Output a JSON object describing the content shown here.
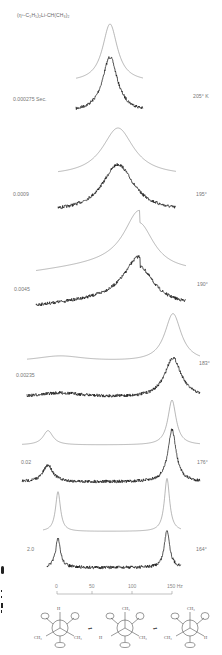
{
  "figure": {
    "title": "(η⁵-C₅H₅)₂Li-CH(CH₃)₂",
    "x_axis": {
      "unit": "Hz",
      "ticks": [
        {
          "value": 0,
          "label": "0"
        },
        {
          "value": 50,
          "label": "50"
        },
        {
          "value": 100,
          "label": "100"
        },
        {
          "value": 150,
          "label": "150 Hz"
        }
      ]
    },
    "rows": [
      {
        "lifetime_label": "0.000275 Sec.",
        "temperature_label": "205° K"
      },
      {
        "lifetime_label": "0.0009",
        "temperature_label": "195°"
      },
      {
        "lifetime_label": "0.0045",
        "temperature_label": "190°"
      },
      {
        "lifetime_label": "0.00235",
        "temperature_label": "183°"
      },
      {
        "lifetime_label": "0.02",
        "temperature_label": "176°"
      },
      {
        "lifetime_label": "2.0",
        "temperature_label": "164°"
      }
    ],
    "newman_projections": [
      {
        "top": "H",
        "left": "CH₃",
        "right": "CH₃"
      },
      {
        "top": "CH₃",
        "left": "H",
        "right": "CH₃"
      },
      {
        "top": "CH₃",
        "left": "CH₃",
        "right": "H"
      }
    ],
    "equilibrium_symbol": "⇌"
  },
  "chart_data": {
    "type": "line",
    "xlabel": "Hz",
    "xlim": [
      0,
      150
    ],
    "x_ticks": [
      0,
      50,
      100,
      150
    ],
    "series": [
      {
        "name": "205° K",
        "tau_sec": 0.000275,
        "peaks": [
          {
            "center_hz": 75,
            "width": "narrow"
          }
        ],
        "shape": "single coalesced peak"
      },
      {
        "name": "195°",
        "tau_sec": 0.0009,
        "peaks": [
          {
            "center_hz": 90,
            "width": "broad"
          }
        ],
        "shape": "single broad peak"
      },
      {
        "name": "190°",
        "tau_sec": 0.0045,
        "peaks": [
          {
            "center_hz": 105,
            "width": "broad"
          }
        ],
        "shape": "asymmetric broad peak with shoulder at low field"
      },
      {
        "name": "183°",
        "tau_sec": 0.00235,
        "peaks": [
          {
            "center_hz": 135,
            "width": "medium"
          }
        ],
        "shape": "main peak near 135 Hz with weak low-field plateau"
      },
      {
        "name": "176°",
        "tau_sec": 0.02,
        "peaks": [
          {
            "center_hz": 8,
            "width": "medium"
          },
          {
            "center_hz": 138,
            "width": "narrow"
          }
        ],
        "shape": "two peaks"
      },
      {
        "name": "164°",
        "tau_sec": 2.0,
        "peaks": [
          {
            "center_hz": 5,
            "width": "narrow"
          },
          {
            "center_hz": 138,
            "width": "very narrow"
          }
        ],
        "shape": "two sharp peaks (slow exchange)"
      }
    ]
  }
}
